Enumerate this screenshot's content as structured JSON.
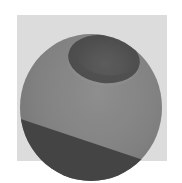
{
  "image": {
    "description": "Grayscale halftone rendering of a sphere with an elliptical dimple at the top and a dark diagonal band across the lower portion",
    "subject": "sphere",
    "features": [
      "dimple",
      "dark-band"
    ],
    "colors": {
      "page_background": "#ffffff",
      "halftone_background": "#ececec",
      "sphere_body": "#8c8c8c",
      "dimple": "#555555",
      "lower_band": "#4a4a4a"
    }
  }
}
